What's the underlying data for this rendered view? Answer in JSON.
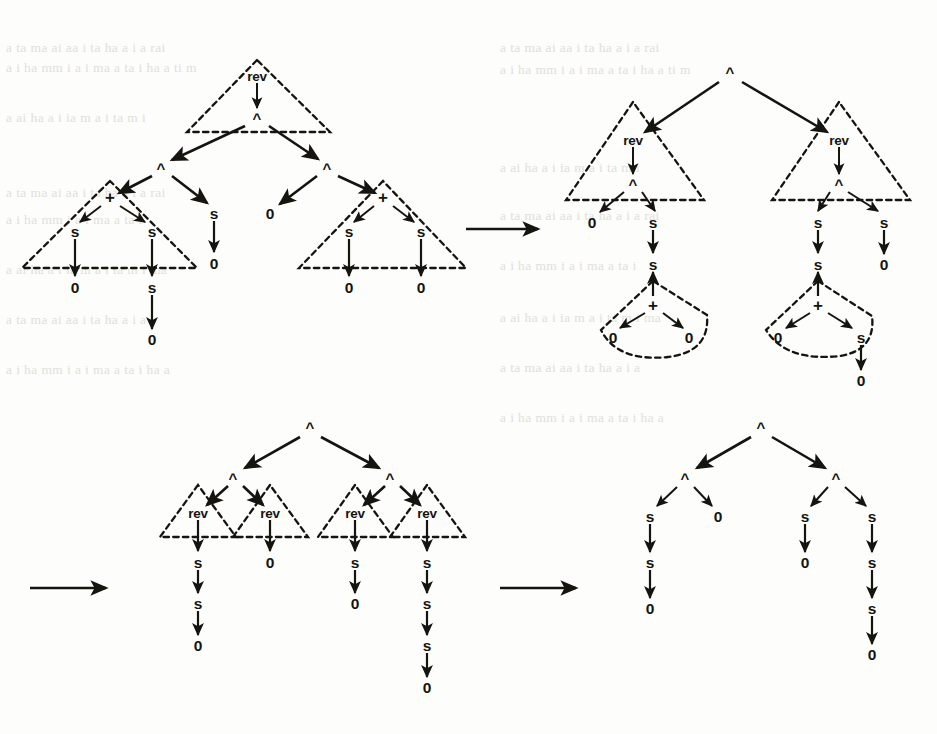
{
  "figure": {
    "kind": "term-graph-rewriting-sequence",
    "ink_color": "#16140f",
    "paper_color": "#fdfdfb",
    "ghost_color": "#cfcfc8",
    "symbols": {
      "cons": "^",
      "rev": "rev",
      "plus": "+",
      "succ": "s",
      "zero": "0"
    },
    "transition_arrows": [
      {
        "name": "rewrite-arrow-1",
        "x1": 466,
        "y1": 229,
        "x2": 542,
        "y2": 229
      },
      {
        "name": "rewrite-arrow-2",
        "x1": 30,
        "y1": 588,
        "x2": 110,
        "y2": 588
      },
      {
        "name": "rewrite-arrow-3",
        "x1": 500,
        "y1": 588,
        "x2": 580,
        "y2": 588
      }
    ],
    "background_bleed_lines": [
      "a ta ma ai aa i  ta  ha  a  i  a  rai",
      "a  i  ha  mm  i   a  i  ma a  ta  i   ha  a  ti  m",
      "a  ai ha a  i  ia  m  a  i  ta m i",
      "a ta ma ai aa i  ta  ha  a  i  a  rai",
      "a  i  ha  mm  i   a  i  ma a  ta  i",
      "a  ai ha a  i  ia  m  a  i  ta m i  ma",
      "a ta ma ai aa i  ta  ha  a  i  a",
      "a  i  ha  mm  i   a  i  ma a  ta  i   ha  a"
    ]
  },
  "graphs": [
    {
      "id": "graph-1",
      "name": "term-graph-initial",
      "position": "top-left",
      "root": "rev",
      "note": "rev applied to a cons-list of two sums",
      "nodes": [
        {
          "id": "g1-rev",
          "label": "rev",
          "x": 257,
          "y": 76,
          "kind": "function"
        },
        {
          "id": "g1-c0",
          "label": "^",
          "x": 257,
          "y": 118,
          "kind": "cons"
        },
        {
          "id": "g1-c1",
          "label": "^",
          "x": 161,
          "y": 168,
          "kind": "cons"
        },
        {
          "id": "g1-c2",
          "label": "^",
          "x": 327,
          "y": 168,
          "kind": "cons"
        },
        {
          "id": "g1-p1",
          "label": "+",
          "x": 110,
          "y": 197,
          "kind": "plus"
        },
        {
          "id": "g1-s1a",
          "label": "s",
          "x": 75,
          "y": 231,
          "kind": "succ"
        },
        {
          "id": "g1-s1b",
          "label": "s",
          "x": 152,
          "y": 231,
          "kind": "succ"
        },
        {
          "id": "g1-z1a",
          "label": "0",
          "x": 75,
          "y": 287,
          "kind": "zero"
        },
        {
          "id": "g1-s1c",
          "label": "s",
          "x": 152,
          "y": 287,
          "kind": "succ"
        },
        {
          "id": "g1-z1b",
          "label": "0",
          "x": 152,
          "y": 339,
          "kind": "zero"
        },
        {
          "id": "g1-s2",
          "label": "s",
          "x": 214,
          "y": 213,
          "kind": "succ"
        },
        {
          "id": "g1-z2",
          "label": "0",
          "x": 214,
          "y": 263,
          "kind": "zero"
        },
        {
          "id": "g1-z3",
          "label": "0",
          "x": 270,
          "y": 213,
          "kind": "zero"
        },
        {
          "id": "g1-p2",
          "label": "+",
          "x": 383,
          "y": 197,
          "kind": "plus"
        },
        {
          "id": "g1-s3a",
          "label": "s",
          "x": 349,
          "y": 231,
          "kind": "succ"
        },
        {
          "id": "g1-s3b",
          "label": "s",
          "x": 421,
          "y": 231,
          "kind": "succ"
        },
        {
          "id": "g1-z4a",
          "label": "0",
          "x": 349,
          "y": 287,
          "kind": "zero"
        },
        {
          "id": "g1-z4b",
          "label": "0",
          "x": 421,
          "y": 287,
          "kind": "zero"
        }
      ],
      "redex_shapes": [
        {
          "name": "redex-rev-top",
          "type": "triangle",
          "apex": [
            257,
            62
          ],
          "left": [
            188,
            131
          ],
          "right": [
            330,
            131
          ]
        },
        {
          "name": "redex-plus-left",
          "type": "triangle",
          "apex": [
            110,
            183
          ],
          "left": [
            22,
            268
          ],
          "right": [
            196,
            268
          ]
        },
        {
          "name": "redex-plus-right",
          "type": "triangle",
          "apex": [
            383,
            183
          ],
          "left": [
            300,
            268
          ],
          "right": [
            465,
            268
          ]
        }
      ]
    },
    {
      "id": "graph-2",
      "name": "term-graph-step-1",
      "position": "top-right",
      "root": "^",
      "note": "cons of two rev-redexes over evaluated sums",
      "nodes": [
        {
          "id": "g2-c0",
          "label": "^",
          "x": 730,
          "y": 72,
          "kind": "cons"
        },
        {
          "id": "g2-rvL",
          "label": "rev",
          "x": 633,
          "y": 140,
          "kind": "function"
        },
        {
          "id": "g2-rvR",
          "label": "rev",
          "x": 839,
          "y": 140,
          "kind": "function"
        },
        {
          "id": "g2-cL",
          "label": "^",
          "x": 633,
          "y": 184,
          "kind": "cons"
        },
        {
          "id": "g2-cR",
          "label": "^",
          "x": 839,
          "y": 184,
          "kind": "cons"
        },
        {
          "id": "g2-zL",
          "label": "0",
          "x": 592,
          "y": 222,
          "kind": "zero"
        },
        {
          "id": "g2-sL",
          "label": "s",
          "x": 653,
          "y": 222,
          "kind": "succ"
        },
        {
          "id": "g2-sL2",
          "label": "s",
          "x": 653,
          "y": 264,
          "kind": "succ"
        },
        {
          "id": "g2-pL",
          "label": "+",
          "x": 653,
          "y": 305,
          "kind": "plus"
        },
        {
          "id": "g2-zL1",
          "label": "0",
          "x": 613,
          "y": 337,
          "kind": "zero"
        },
        {
          "id": "g2-zL2",
          "label": "0",
          "x": 689,
          "y": 337,
          "kind": "zero"
        },
        {
          "id": "g2-sR",
          "label": "s",
          "x": 818,
          "y": 222,
          "kind": "succ"
        },
        {
          "id": "g2-sR2",
          "label": "s",
          "x": 818,
          "y": 264,
          "kind": "succ"
        },
        {
          "id": "g2-pR",
          "label": "+",
          "x": 818,
          "y": 305,
          "kind": "plus"
        },
        {
          "id": "g2-zR1",
          "label": "0",
          "x": 778,
          "y": 337,
          "kind": "zero"
        },
        {
          "id": "g2-sR3",
          "label": "s",
          "x": 861,
          "y": 337,
          "kind": "succ"
        },
        {
          "id": "g2-zR4",
          "label": "0",
          "x": 861,
          "y": 380,
          "kind": "zero"
        },
        {
          "id": "g2-sRr",
          "label": "s",
          "x": 884,
          "y": 222,
          "kind": "succ"
        },
        {
          "id": "g2-zRr",
          "label": "0",
          "x": 884,
          "y": 264,
          "kind": "zero"
        }
      ],
      "redex_shapes": [
        {
          "name": "redex-rev-left",
          "type": "triangle",
          "apex": [
            633,
            104
          ],
          "left": [
            567,
            200
          ],
          "right": [
            705,
            200
          ]
        },
        {
          "name": "redex-rev-right",
          "type": "triangle",
          "apex": [
            839,
            104
          ],
          "left": [
            773,
            200
          ],
          "right": [
            910,
            200
          ]
        },
        {
          "name": "redex-plus-left-curved",
          "type": "curved"
        },
        {
          "name": "redex-plus-right-curved",
          "type": "curved"
        }
      ]
    },
    {
      "id": "graph-3",
      "name": "term-graph-step-2",
      "position": "bottom-left",
      "root": "^",
      "note": "cons tree over four rev-redexes on numerals",
      "nodes": [
        {
          "id": "g3-c0",
          "label": "^",
          "x": 310,
          "y": 427,
          "kind": "cons"
        },
        {
          "id": "g3-cL",
          "label": "^",
          "x": 233,
          "y": 478,
          "kind": "cons"
        },
        {
          "id": "g3-cR",
          "label": "^",
          "x": 390,
          "y": 478,
          "kind": "cons"
        },
        {
          "id": "g3-r1",
          "label": "rev",
          "x": 198,
          "y": 513,
          "kind": "function"
        },
        {
          "id": "g3-r2",
          "label": "rev",
          "x": 270,
          "y": 513,
          "kind": "function"
        },
        {
          "id": "g3-r3",
          "label": "rev",
          "x": 355,
          "y": 513,
          "kind": "function"
        },
        {
          "id": "g3-r4",
          "label": "rev",
          "x": 427,
          "y": 513,
          "kind": "function"
        },
        {
          "id": "g3-a1",
          "label": "s",
          "x": 198,
          "y": 562,
          "kind": "succ"
        },
        {
          "id": "g3-a2",
          "label": "s",
          "x": 198,
          "y": 603,
          "kind": "succ"
        },
        {
          "id": "g3-a3",
          "label": "0",
          "x": 198,
          "y": 645,
          "kind": "zero"
        },
        {
          "id": "g3-b1",
          "label": "0",
          "x": 270,
          "y": 562,
          "kind": "zero"
        },
        {
          "id": "g3-c1",
          "label": "s",
          "x": 355,
          "y": 562,
          "kind": "succ"
        },
        {
          "id": "g3-c2",
          "label": "0",
          "x": 355,
          "y": 603,
          "kind": "zero"
        },
        {
          "id": "g3-d1",
          "label": "s",
          "x": 427,
          "y": 562,
          "kind": "succ"
        },
        {
          "id": "g3-d2",
          "label": "s",
          "x": 427,
          "y": 603,
          "kind": "succ"
        },
        {
          "id": "g3-d3",
          "label": "s",
          "x": 427,
          "y": 645,
          "kind": "succ"
        },
        {
          "id": "g3-d4",
          "label": "0",
          "x": 427,
          "y": 687,
          "kind": "zero"
        }
      ],
      "redex_shapes": [
        {
          "name": "redex-rev-1",
          "type": "triangle",
          "apex": [
            198,
            487
          ],
          "left": [
            163,
            535
          ],
          "right": [
            235,
            535
          ]
        },
        {
          "name": "redex-rev-2",
          "type": "triangle",
          "apex": [
            270,
            487
          ],
          "left": [
            235,
            535
          ],
          "right": [
            307,
            535
          ]
        },
        {
          "name": "redex-rev-3",
          "type": "triangle",
          "apex": [
            355,
            487
          ],
          "left": [
            320,
            535
          ],
          "right": [
            392,
            535
          ]
        },
        {
          "name": "redex-rev-4",
          "type": "triangle",
          "apex": [
            427,
            487
          ],
          "left": [
            392,
            535
          ],
          "right": [
            464,
            535
          ]
        }
      ]
    },
    {
      "id": "graph-4",
      "name": "term-graph-final",
      "position": "bottom-right",
      "root": "^",
      "note": "fully reduced cons tree of numerals",
      "nodes": [
        {
          "id": "g4-c0",
          "label": "^",
          "x": 761,
          "y": 427,
          "kind": "cons"
        },
        {
          "id": "g4-cL",
          "label": "^",
          "x": 685,
          "y": 478,
          "kind": "cons"
        },
        {
          "id": "g4-cR",
          "label": "^",
          "x": 836,
          "y": 478,
          "kind": "cons"
        },
        {
          "id": "g4-a1",
          "label": "s",
          "x": 650,
          "y": 516,
          "kind": "succ"
        },
        {
          "id": "g4-a2",
          "label": "s",
          "x": 650,
          "y": 562,
          "kind": "succ"
        },
        {
          "id": "g4-a3",
          "label": "0",
          "x": 650,
          "y": 608,
          "kind": "zero"
        },
        {
          "id": "g4-b1",
          "label": "0",
          "x": 718,
          "y": 516,
          "kind": "zero"
        },
        {
          "id": "g4-c1",
          "label": "s",
          "x": 805,
          "y": 516,
          "kind": "succ"
        },
        {
          "id": "g4-c2",
          "label": "0",
          "x": 805,
          "y": 562,
          "kind": "zero"
        },
        {
          "id": "g4-d1",
          "label": "s",
          "x": 872,
          "y": 516,
          "kind": "succ"
        },
        {
          "id": "g4-d2",
          "label": "s",
          "x": 872,
          "y": 562,
          "kind": "succ"
        },
        {
          "id": "g4-d3",
          "label": "s",
          "x": 872,
          "y": 608,
          "kind": "succ"
        },
        {
          "id": "g4-d4",
          "label": "0",
          "x": 872,
          "y": 654,
          "kind": "zero"
        }
      ],
      "redex_shapes": []
    }
  ]
}
